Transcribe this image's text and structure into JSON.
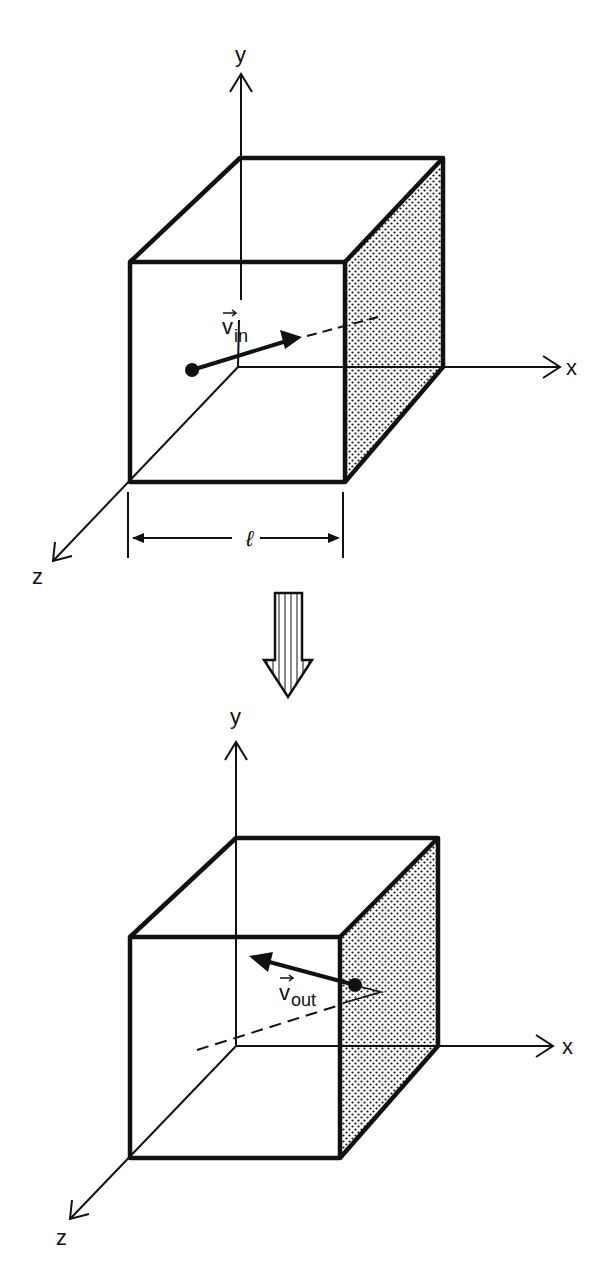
{
  "figure": {
    "colors": {
      "ink": "#111111",
      "background": "#ffffff",
      "wall_dots": "#111111"
    }
  },
  "top_panel": {
    "axis_labels": {
      "x": "x",
      "y": "y",
      "z": "z"
    },
    "velocity": {
      "symbol": "v",
      "subscript": "in"
    },
    "dimension_label": "ℓ",
    "shaded_wall": "right face (x = ℓ)"
  },
  "transition_arrow": {
    "direction": "down",
    "style": "hatched"
  },
  "bottom_panel": {
    "axis_labels": {
      "x": "x",
      "y": "y",
      "z": "z"
    },
    "velocity": {
      "symbol": "v",
      "subscript": "out"
    },
    "shaded_wall": "right face (x = ℓ)"
  }
}
